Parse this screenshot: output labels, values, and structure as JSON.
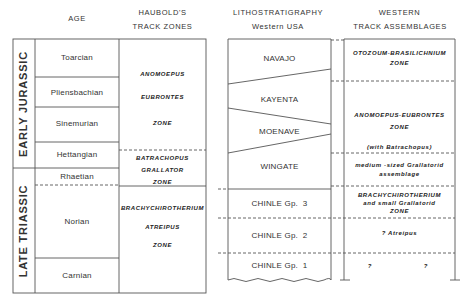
{
  "headers": {
    "age": "AGE",
    "haubold_line1": "HAUBOLD'S",
    "haubold_line2": "TRACK ZONES",
    "litho_line1": "LITHOSTRATIGRAPHY",
    "litho_line2": "Western USA",
    "western_line1": "WESTERN",
    "western_line2": "TRACK ASSEMBLAGES"
  },
  "epochs": [
    {
      "label": "EARLY JURASSIC"
    },
    {
      "label": "LATE TRIASSIC"
    }
  ],
  "ages": [
    {
      "label": "Toarcian"
    },
    {
      "label": "Pliensbachian"
    },
    {
      "label": "Sinemurian"
    },
    {
      "label": "Hettangian"
    },
    {
      "label": "Rhaetian"
    },
    {
      "label": "Norian"
    },
    {
      "label": "Carnian"
    }
  ],
  "haubold_zones": [
    {
      "lines": [
        "ANOMOEPUS",
        "EUBRONTES",
        "ZONE"
      ]
    },
    {
      "lines": [
        "BATRACHOPUS",
        "GRALLATOR",
        "ZONE"
      ]
    },
    {
      "lines": [
        "BRACHYCHIROTHERIUM",
        "ATREIPUS",
        "ZONE"
      ]
    }
  ],
  "lithostratigraphy": [
    {
      "label": "NAVAJO"
    },
    {
      "label": "KAYENTA"
    },
    {
      "label": "MOENAVE"
    },
    {
      "label": "WINGATE"
    },
    {
      "label": "CHINLE Gp.  3"
    },
    {
      "label": "CHINLE Gp.  2"
    },
    {
      "label": "CHINLE Gp.  1"
    }
  ],
  "western_assemblages": [
    {
      "lines": [
        "OTOZOUM-BRASILICHNIUM",
        "ZONE"
      ]
    },
    {
      "lines": [
        "ANOMOEPUS-EUBRONTES",
        "ZONE"
      ]
    },
    {
      "lines": [
        "(with Batrachopus)"
      ]
    },
    {
      "lines": [
        "medium -sized Grallatorid",
        "assemblage"
      ]
    },
    {
      "lines": [
        "BRACHYCHIROTHERIUM",
        "and small Grallatorid",
        "ZONE"
      ]
    },
    {
      "lines": [
        "? Atreipus"
      ]
    },
    {
      "lines": [
        "?",
        "?"
      ]
    }
  ],
  "colors": {
    "line": "#555555",
    "text": "#2a2a2a",
    "background": "#ffffff"
  }
}
